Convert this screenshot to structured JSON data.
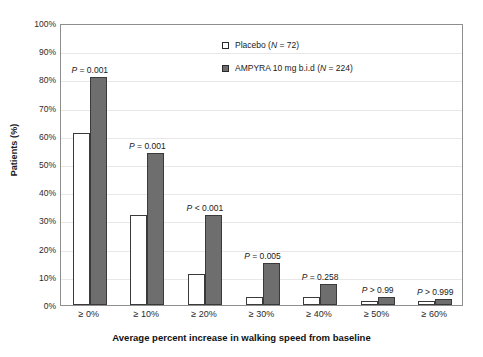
{
  "chart_data": {
    "type": "bar",
    "title": "",
    "xlabel": "Average percent increase in walking speed from baseline",
    "ylabel": "Patients (%)",
    "categories": [
      "≥ 0%",
      "≥ 10%",
      "≥ 20%",
      "≥ 30%",
      "≥ 40%",
      "≥ 50%",
      "≥ 60%"
    ],
    "series": [
      {
        "name": "Placebo (N = 72)",
        "values": [
          61,
          32,
          11,
          3,
          3,
          1.5,
          1.5
        ],
        "color": "#ffffff",
        "edge_color": "#3a3a3a"
      },
      {
        "name": "AMPYRA 10 mg b.i.d (N = 224)",
        "values": [
          81,
          54,
          32,
          15,
          7.5,
          3,
          2
        ],
        "color": "#6e6e6e",
        "edge_color": "#3a3a3a"
      }
    ],
    "annotations": [
      "P = 0.001",
      "P = 0.001",
      "P < 0.001",
      "P = 0.005",
      "P = 0.258",
      "P > 0.99",
      "P > 0.999"
    ],
    "ylim": [
      0,
      100
    ],
    "yticks": [
      "0%",
      "10%",
      "20%",
      "30%",
      "40%",
      "50%",
      "60%",
      "70%",
      "80%",
      "90%",
      "100%"
    ],
    "ytick_values": [
      0,
      10,
      20,
      30,
      40,
      50,
      60,
      70,
      80,
      90,
      100
    ],
    "grid": true,
    "legend_position": "upper right"
  },
  "axes": {
    "y_title": "Patients (%)",
    "x_title": "Average percent increase in walking speed from baseline"
  },
  "legend": {
    "items": [
      {
        "label_prefix": "Placebo (",
        "label_italic": "N",
        "label_suffix": " = 72)",
        "marker": "open-square"
      },
      {
        "label_prefix": "AMPYRA 10 mg b.i.d (",
        "label_italic": "N",
        "label_suffix": " = 224)",
        "marker": "filled-square"
      }
    ]
  },
  "pvalues": [
    {
      "italic": "P",
      "rest": " = 0.001"
    },
    {
      "italic": "P",
      "rest": " = 0.001"
    },
    {
      "italic": "P",
      "rest": " < 0.001"
    },
    {
      "italic": "P",
      "rest": " = 0.005"
    },
    {
      "italic": "P",
      "rest": " = 0.258"
    },
    {
      "italic": "P",
      "rest": " > 0.99"
    },
    {
      "italic": "P",
      "rest": " > 0.999"
    }
  ]
}
